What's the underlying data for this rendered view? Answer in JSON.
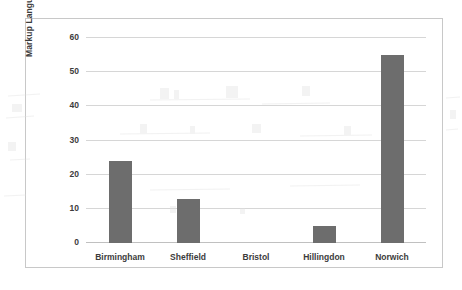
{
  "chart_data": {
    "type": "bar",
    "title": "",
    "xlabel": "",
    "ylabel": "Markup Language Issues",
    "categories": [
      "Birmingham",
      "Sheffield",
      "Bristol",
      "Hillingdon",
      "Norwich"
    ],
    "values": [
      24,
      13,
      0,
      5,
      55
    ],
    "ylim": [
      0,
      60
    ],
    "yticks": [
      0,
      10,
      20,
      30,
      40,
      50,
      60
    ],
    "ytick_labels": [
      "0",
      "10",
      "20",
      "30",
      "40",
      "50",
      "60"
    ],
    "grid": true,
    "legend": "none",
    "bar_color": "#6d6d6d",
    "grid_color": "#d6d6d6",
    "axis_color": "#c0c0c0",
    "text_color": "#3c3c3c",
    "border_color": "#c8c8c8",
    "background": "#ffffff"
  }
}
